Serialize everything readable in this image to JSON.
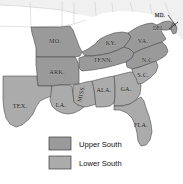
{
  "figure": {
    "kind": "thematic-map",
    "region": "Southern United States",
    "background_color": "#ffffff"
  },
  "colors": {
    "upper_south_fill": "#9a9a9a",
    "lower_south_fill": "#ababab",
    "non_south_fill": "#f0f0f0",
    "border_stroke": "#4a4a4a",
    "faint_border_stroke": "#c9c9c9",
    "label_color": "#1a1a1a",
    "legend_text_color": "#111111"
  },
  "states": [
    {
      "id": "missouri",
      "label": "MO.",
      "group": "upper",
      "lx": 55,
      "ly": 43
    },
    {
      "id": "kentucky",
      "label": "KY.",
      "group": "upper",
      "lx": 111,
      "ly": 45
    },
    {
      "id": "virginia",
      "label": "VA.",
      "group": "upper",
      "lx": 143,
      "ly": 43
    },
    {
      "id": "maryland",
      "label": "MD.",
      "group": "upper",
      "lx": 160,
      "ly": 17
    },
    {
      "id": "delaware",
      "label": "DEL.",
      "group": "upper",
      "lx": 159,
      "ly": 30
    },
    {
      "id": "tennessee",
      "label": "TENN.",
      "group": "upper",
      "lx": 103,
      "ly": 62
    },
    {
      "id": "arkansas",
      "label": "ARK.",
      "group": "upper",
      "lx": 57,
      "ly": 74
    },
    {
      "id": "north-carolina",
      "label": "N.C.",
      "group": "upper",
      "lx": 148,
      "ly": 62
    },
    {
      "id": "south-carolina",
      "label": "S.C.",
      "group": "lower",
      "lx": 143,
      "ly": 77
    },
    {
      "id": "mississippi",
      "label": "MISS.",
      "group": "lower",
      "lx": 79,
      "ly": 92
    },
    {
      "id": "alabama",
      "label": "ALA.",
      "group": "lower",
      "lx": 102,
      "ly": 90
    },
    {
      "id": "georgia",
      "label": "GA.",
      "group": "lower",
      "lx": 124,
      "ly": 91
    },
    {
      "id": "louisiana",
      "label": "LA.",
      "group": "lower",
      "lx": 60,
      "ly": 107
    },
    {
      "id": "texas",
      "label": "TEX.",
      "group": "lower",
      "lx": 19,
      "ly": 108
    },
    {
      "id": "florida",
      "label": "FLA.",
      "group": "lower",
      "lx": 140,
      "ly": 126
    }
  ],
  "legend": {
    "items": [
      {
        "id": "upper-south",
        "label": "Upper South",
        "swatch_color": "#9a9a9a"
      },
      {
        "id": "lower-south",
        "label": "Lower South",
        "swatch_color": "#ababab"
      }
    ]
  }
}
